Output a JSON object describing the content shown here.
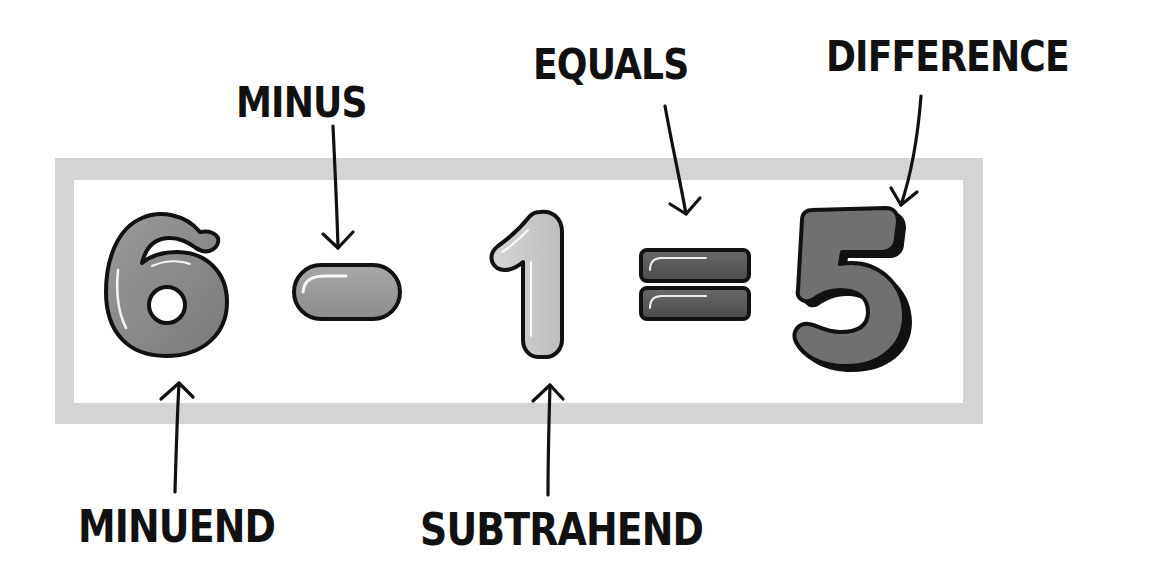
{
  "diagram": {
    "equation": {
      "minuend": "6",
      "operator_minus": "−",
      "subtrahend": "1",
      "operator_equals": "=",
      "difference": "5"
    },
    "labels": {
      "minus": "MINUS",
      "equals": "EQUALS",
      "difference": "DIFFERENCE",
      "minuend": "MINUEND",
      "subtrahend": "SUBTRAHEND"
    },
    "colors": {
      "frame": "#d4d4d4",
      "minuend_fill": "#8a8a8a",
      "minus_fill": "#9c9c9c",
      "subtrahend_fill": "#cbcbcb",
      "equals_fill": "#5a5a5a",
      "difference_fill": "#707070",
      "outline": "#111111",
      "text": "#111111"
    }
  }
}
